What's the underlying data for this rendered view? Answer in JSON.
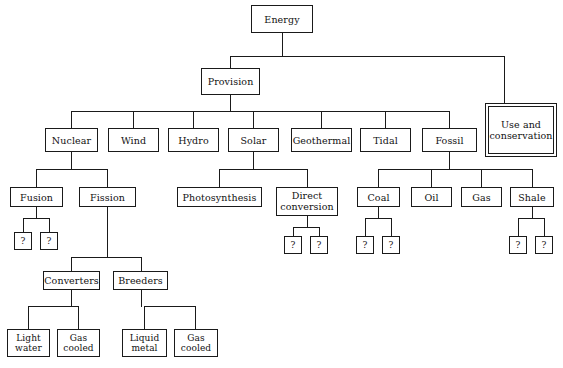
{
  "diagram": {
    "type": "hierarchy-tree",
    "background_color": "#ffffff",
    "line_color": "#1a1a1a",
    "text_color": "#111111"
  },
  "nodes": {
    "root": {
      "label": "Energy"
    },
    "provision": {
      "label": "Provision"
    },
    "use_conservation": {
      "label": "Use and conservation"
    },
    "nuclear": {
      "label": "Nuclear"
    },
    "wind": {
      "label": "Wind"
    },
    "hydro": {
      "label": "Hydro"
    },
    "solar": {
      "label": "Solar"
    },
    "geothermal": {
      "label": "Geothermal"
    },
    "tidal": {
      "label": "Tidal"
    },
    "fossil": {
      "label": "Fossil"
    },
    "fusion": {
      "label": "Fusion"
    },
    "fission": {
      "label": "Fission"
    },
    "photosynthesis": {
      "label": "Photosynthesis"
    },
    "direct_conversion": {
      "label": "Direct conversion"
    },
    "coal": {
      "label": "Coal"
    },
    "oil": {
      "label": "Oil"
    },
    "gas": {
      "label": "Gas"
    },
    "shale": {
      "label": "Shale"
    },
    "converters": {
      "label": "Converters"
    },
    "breeders": {
      "label": "Breeders"
    },
    "light_water": {
      "label": "Light water"
    },
    "gas_cooled_conv": {
      "label": "Gas cooled"
    },
    "liquid_metal": {
      "label": "Liquid metal"
    },
    "gas_cooled_breed": {
      "label": "Gas cooled"
    },
    "q_fusion_1": {
      "label": "?"
    },
    "q_fusion_2": {
      "label": "?"
    },
    "q_direct_1": {
      "label": "?"
    },
    "q_direct_2": {
      "label": "?"
    },
    "q_coal_1": {
      "label": "?"
    },
    "q_coal_2": {
      "label": "?"
    },
    "q_shale_1": {
      "label": "?"
    },
    "q_shale_2": {
      "label": "?"
    }
  }
}
